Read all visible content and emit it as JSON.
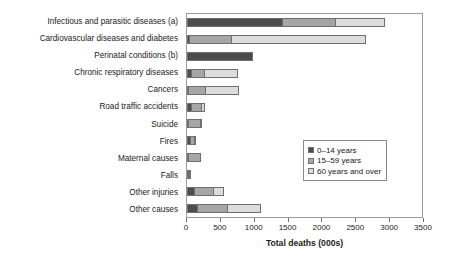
{
  "chart_data": {
    "type": "bar",
    "orientation": "horizontal",
    "stacked": true,
    "title": "",
    "xlabel": "Total deaths (000s)",
    "ylabel": "",
    "xlim": [
      0,
      3500
    ],
    "xticks": [
      0,
      500,
      1000,
      1500,
      2000,
      2500,
      3000,
      3500
    ],
    "xtick_labels": [
      "0",
      "500",
      "1000",
      "1500",
      "2000",
      "2500",
      "3000",
      "3500"
    ],
    "grid": false,
    "legend_position": "center-right",
    "categories": [
      "Infectious and parasitic diseases (a)",
      "Cardiovascular diseases and diabetes",
      "Perinatal conditions (b)",
      "Chronic respiratory diseases",
      "Cancers",
      "Road traffic accidents",
      "Suicide",
      "Fires",
      "Maternal causes",
      "Falls",
      "Other injuries",
      "Other causes"
    ],
    "series": [
      {
        "name": "0–14 years",
        "color": "#4d4d4d",
        "values": [
          1400,
          30,
          970,
          60,
          20,
          60,
          10,
          40,
          10,
          10,
          110,
          150
        ]
      },
      {
        "name": "15–59 years",
        "color": "#a6a6a6",
        "values": [
          790,
          620,
          0,
          190,
          250,
          150,
          180,
          60,
          190,
          20,
          270,
          440
        ]
      },
      {
        "name": "60 years and over",
        "color": "#dcdcdc",
        "values": [
          730,
          2000,
          0,
          500,
          500,
          50,
          30,
          20,
          0,
          30,
          170,
          510
        ]
      }
    ],
    "totals": [
      2920,
      2650,
      970,
      750,
      770,
      260,
      220,
      120,
      200,
      60,
      550,
      1100
    ]
  },
  "legend": {
    "items": [
      {
        "label": "0–14 years"
      },
      {
        "label": "15–59 years"
      },
      {
        "label": "60 years and over"
      }
    ]
  }
}
